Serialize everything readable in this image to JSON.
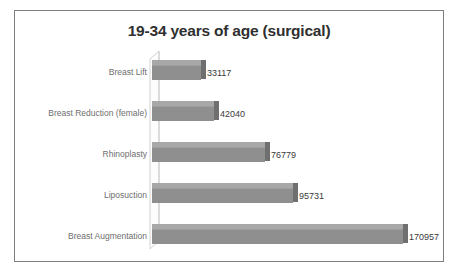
{
  "top_sliver": {
    "text": " "
  },
  "chart": {
    "title": "19-34 years of age (surgical)",
    "frame_color": "#7d7d7d",
    "bar_color": "#8f8f8f",
    "bar_top_color": "#a8a8a8",
    "bar_side_color": "#6f6f6f",
    "label_color": "#6e6e6e",
    "value_color": "#3a3a3a",
    "title_color": "#2f2f2f",
    "background": "#ffffff"
  },
  "chart_data": {
    "type": "bar",
    "orientation": "horizontal",
    "style": "3d",
    "title": "19-34 years of age (surgical)",
    "xlabel": "",
    "ylabel": "",
    "grid": false,
    "legend": "none",
    "xlim": [
      0,
      185000
    ],
    "categories": [
      "Breast Lift",
      "Breast Reduction (female)",
      "Rhinoplasty",
      "Liposuction",
      "Breast Augmentation"
    ],
    "values": [
      33117,
      42040,
      76779,
      95731,
      170957
    ],
    "value_labels": [
      "33117",
      "42040",
      "76779",
      "95731",
      "170957"
    ]
  }
}
